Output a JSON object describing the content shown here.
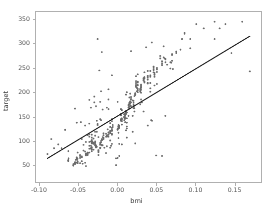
{
  "chart_data": {
    "type": "scatter",
    "title": "",
    "xlabel": "bmi",
    "ylabel": "target",
    "xlim": [
      -0.105,
      0.185
    ],
    "ylim": [
      14,
      366
    ],
    "xticks": [
      -0.1,
      -0.05,
      0.0,
      0.05,
      0.1,
      0.15
    ],
    "xtick_labels": [
      "-0.10",
      "-0.05",
      "0.00",
      "0.05",
      "0.10",
      "0.15"
    ],
    "yticks": [
      50,
      100,
      150,
      200,
      250,
      300,
      350
    ],
    "ytick_labels": [
      "50",
      "100",
      "150",
      "200",
      "250",
      "300",
      "350"
    ],
    "grid": false,
    "legend": null,
    "marker_color": "#6b6b6b",
    "marker_size": 1.7,
    "line_color": "#1a1a1a",
    "regression_line": {
      "x": [
        -0.0902,
        0.1706
      ],
      "y": [
        63.0,
        316.0
      ],
      "slope": 970.0,
      "intercept": 150.5
    },
    "n_points": 442,
    "x": [
      0.0617,
      -0.0514,
      0.0445,
      -0.0116,
      -0.0364,
      -0.0407,
      -0.0472,
      -0.0019,
      -0.0288,
      -0.0256,
      -0.0197,
      0.0498,
      -0.0299,
      -0.0116,
      0.0196,
      -0.0277,
      -0.0547,
      -0.0223,
      -0.0321,
      -0.0342,
      0.0024,
      -0.0018,
      0.0574,
      -0.0234,
      -0.0363,
      -0.0212,
      -0.0525,
      -0.0169,
      0.0391,
      -0.0202,
      -0.0266,
      -0.0342,
      -0.0115,
      0.0714,
      -0.0245,
      0.0175,
      -0.0061,
      0.0023,
      -0.0438,
      0.012,
      -0.0094,
      -0.0417,
      0.0304,
      0.0434,
      -0.0514,
      -0.0331,
      0.0315,
      -0.046,
      -0.0256,
      -0.0633,
      0.012,
      -0.0256,
      -0.046,
      -0.0072,
      0.0002,
      0.0229,
      0.0607,
      -0.0331,
      -0.0147,
      0.0595,
      -0.0212,
      -0.0363,
      -0.0482,
      0.0239,
      -0.0309,
      0.0218,
      0.0045,
      -0.0223,
      0.011,
      0.039,
      -0.0331,
      0.0153,
      -0.0417,
      0.0293,
      -0.0072,
      0.0682,
      -0.0202,
      -0.0299,
      0.0023,
      -0.0288,
      0.0369,
      -0.0137,
      -0.0094,
      -0.0083,
      0.0477,
      0.0832,
      -0.0245,
      -0.0277,
      0.0347,
      0.0261,
      -0.0277,
      -0.0536,
      -0.0191,
      0.011,
      -0.0331,
      0.0142,
      -0.0094,
      0.0239,
      -0.0525,
      0.0013,
      -0.0126,
      -0.0515,
      0.0196,
      -0.0331,
      0.0002,
      0.0443,
      -0.0148,
      -0.0363,
      0.0336,
      0.0508,
      -0.0223,
      0.012,
      -0.0406,
      0.0175,
      -0.0191,
      0.039,
      -0.0631,
      0.0013,
      -0.0072,
      0.0423,
      -0.0289,
      0.0261,
      -0.0482,
      0.025,
      0.0056,
      -0.0072,
      0.0693,
      -0.0385,
      -0.0137,
      0.0164,
      -0.0569,
      0.0304,
      -0.018,
      0.0088,
      -0.0202,
      0.1016,
      -0.0363,
      0.039,
      -0.0072,
      -0.0288,
      0.0551,
      -0.0223,
      0.0099,
      0.0218,
      -0.0547,
      0.0153,
      -0.0385,
      -0.0137,
      0.0261,
      -0.0633,
      0.0466,
      -0.0309,
      0.0207,
      0.0013,
      -0.0449,
      0.0304,
      -0.0116,
      0.0595,
      -0.0245,
      -0.018,
      0.0477,
      -0.0331,
      0.011,
      0.1252,
      -0.0212,
      0.0088,
      -0.0536,
      0.0336,
      -0.0061,
      -0.0266,
      0.0218,
      0.0704,
      -0.0417,
      0.0013,
      -0.0094,
      0.0239,
      -0.0363,
      0.0153,
      0.0864,
      -0.0277,
      0.0056,
      -0.018,
      0.0423,
      -0.0525,
      0.0196,
      0.0347,
      -0.0148,
      -0.0406,
      0.011,
      0.0574,
      -0.0331,
      0.0261,
      -0.0223,
      0.0682,
      -0.0569,
      0.0175,
      0.0002,
      -0.0288,
      0.039,
      -0.0072,
      0.0304,
      -0.0482,
      0.012,
      0.0508,
      -0.0245,
      -0.0137,
      0.0229,
      0.1317,
      -0.0363,
      0.0045,
      -0.0202,
      0.0466,
      -0.0515,
      0.0088,
      0.0293,
      -0.0331,
      0.0164,
      -0.0094,
      0.0619,
      -0.0277,
      0.0023,
      -0.0438,
      0.0336,
      0.0142,
      -0.0223,
      -0.0633,
      0.025,
      0.0758,
      -0.0309,
      0.0013,
      -0.0116,
      0.0207,
      -0.0385,
      0.0423,
      0.0099,
      -0.0547,
      0.0056,
      -0.0191,
      0.0551,
      -0.0266,
      0.0175,
      -0.046,
      0.0261,
      0.0088,
      -0.0342,
      0.039,
      -0.0072,
      0.0938,
      -0.0212,
      0.012,
      -0.0525,
      0.0304,
      0.0153,
      -0.0288,
      0.0477,
      -0.0137,
      0.0023,
      0.064,
      -0.0363,
      0.0218,
      -0.0406,
      0.0336,
      0.0045,
      -0.0223,
      0.011,
      0.0812,
      -0.0331,
      0.0164,
      -0.0094,
      0.0239,
      -0.0569,
      0.0013,
      0.0466,
      -0.0245,
      0.0099,
      -0.018,
      0.0293,
      -0.0482,
      0.0056,
      0.0574,
      -0.0309,
      0.0142,
      -0.0116,
      0.0207,
      0.0347,
      -0.0277,
      0.0001,
      0.0703,
      -0.0385,
      0.0261,
      -0.0202,
      0.0423,
      0.0088,
      -0.0633,
      0.0175,
      0.0508,
      -0.0342,
      0.012,
      -0.0072,
      0.039,
      -0.0515,
      0.0229,
      0.0304,
      -0.0288,
      0.0153,
      -0.0137,
      0.0619,
      0.0023,
      -0.046,
      0.0336,
      0.0045,
      -0.0223,
      0.0477,
      0.011,
      -0.0331,
      0.0164,
      -0.0094,
      0.0758,
      0.0239,
      -0.0547,
      0.0013,
      0.0466,
      -0.0245,
      0.0099,
      0.0293,
      -0.018,
      0.0056,
      -0.0406,
      0.0574,
      0.0142,
      -0.0309,
      0.0207,
      0.0347,
      -0.0116,
      0.0001,
      -0.0277,
      0.0864,
      0.0261,
      -0.0385,
      0.0423,
      0.0088,
      -0.0202,
      0.0175,
      -0.0633,
      0.0508,
      0.012,
      -0.0342,
      0.039,
      -0.0072,
      0.0229,
      -0.0515,
      0.0304,
      0.0153,
      -0.0288,
      0.0619,
      -0.0137,
      0.0023,
      0.0336,
      -0.046,
      0.0045,
      0.0477,
      -0.0223,
      0.011,
      0.0164,
      -0.0331,
      0.0938,
      -0.0094,
      0.0239,
      0.0013,
      -0.0547,
      0.0466,
      -0.0245,
      0.0099,
      0.0293,
      -0.018,
      0.0056,
      0.0574,
      -0.0406,
      0.0142,
      0.0207,
      -0.0309,
      0.0347,
      -0.0116,
      0.0001,
      0.0703,
      -0.0277,
      0.0261,
      0.0423,
      -0.0385,
      0.0088,
      0.0175,
      -0.0202,
      0.0508,
      -0.0633,
      0.012,
      0.039,
      -0.0342,
      0.0229,
      0.0304,
      -0.0072,
      0.1608,
      0.1706,
      0.1112,
      0.1392,
      -0.0853,
      -0.0902,
      -0.0763,
      -0.0818,
      0.1469,
      -0.0721,
      0.1252,
      -0.0674
    ],
    "y": [
      151,
      75,
      141,
      206,
      135,
      97,
      138,
      63,
      110,
      310,
      101,
      69,
      179,
      185,
      118,
      171,
      166,
      144,
      97,
      168,
      68,
      49,
      68,
      245,
      184,
      202,
      137,
      85,
      131,
      283,
      141,
      98,
      165,
      248,
      80,
      285,
      128,
      129,
      91,
      200,
      85,
      131,
      214,
      142,
      53,
      106,
      179,
      103,
      134,
      78,
      106,
      132,
      57,
      235,
      180,
      94,
      270,
      78,
      108,
      295,
      96,
      108,
      70,
      223,
      81,
      167,
      165,
      85,
      195,
      219,
      99,
      170,
      54,
      175,
      93,
      262,
      90,
      191,
      93,
      90,
      293,
      168,
      128,
      89,
      214,
      310,
      107,
      88,
      220,
      237,
      90,
      60,
      164,
      161,
      112,
      168,
      136,
      219,
      65,
      105,
      123,
      55,
      151,
      85,
      64,
      303,
      74,
      113,
      160,
      217,
      180,
      125,
      47,
      179,
      90,
      244,
      63,
      127,
      144,
      201,
      118,
      220,
      53,
      202,
      92,
      112,
      261,
      70,
      88,
      197,
      48,
      185,
      104,
      142,
      91,
      341,
      75,
      230,
      140,
      93,
      275,
      84,
      138,
      160,
      52,
      189,
      111,
      110,
      200,
      59,
      252,
      104,
      172,
      129,
      52,
      210,
      108,
      272,
      70,
      103,
      232,
      99,
      121,
      346,
      142,
      155,
      54,
      225,
      132,
      118,
      172,
      279,
      77,
      116,
      100,
      233,
      97,
      178,
      321,
      88,
      163,
      115,
      208,
      63,
      183,
      241,
      114,
      73,
      155,
      264,
      101,
      214,
      91,
      249,
      51,
      190,
      124,
      96,
      234,
      126,
      199,
      68,
      146,
      242,
      80,
      109,
      196,
      332,
      89,
      155,
      102,
      246,
      57,
      149,
      206,
      94,
      176,
      120,
      268,
      86,
      131,
      79,
      225,
      174,
      92,
      60,
      209,
      281,
      95,
      129,
      113,
      167,
      73,
      219,
      151,
      55,
      143,
      107,
      270,
      87,
      186,
      65,
      222,
      148,
      84,
      233,
      122,
      310,
      99,
      158,
      61,
      205,
      177,
      91,
      237,
      110,
      128,
      257,
      83,
      192,
      71,
      228,
      152,
      95,
      160,
      288,
      86,
      181,
      119,
      215,
      49,
      125,
      248,
      76,
      147,
      106,
      201,
      64,
      140,
      263,
      93,
      172,
      113,
      178,
      231,
      88,
      123,
      277,
      74,
      207,
      101,
      244,
      154,
      58,
      190,
      250,
      84,
      158,
      120,
      226,
      56,
      198,
      212,
      90,
      175,
      109,
      269,
      127,
      66,
      229,
      144,
      85,
      236,
      159,
      96,
      180,
      115,
      284,
      211,
      51,
      130,
      241,
      78,
      153,
      203,
      111,
      146,
      69,
      259,
      168,
      94,
      174,
      222,
      117,
      124,
      87,
      323,
      215,
      72,
      232,
      149,
      102,
      185,
      57,
      247,
      137,
      89,
      219,
      114,
      196,
      62,
      209,
      166,
      98,
      262,
      108,
      126,
      224,
      67,
      141,
      240,
      92,
      157,
      172,
      82,
      291,
      118,
      213,
      132,
      54,
      253,
      79,
      145,
      207,
      105,
      133,
      256,
      71,
      151,
      182,
      95,
      228,
      112,
      122,
      265,
      86,
      204,
      235,
      75,
      147,
      171,
      103,
      250,
      59,
      129,
      218,
      83,
      194,
      216,
      121,
      346,
      243,
      332,
      341,
      103,
      72,
      92,
      84,
      281,
      84,
      310,
      122
    ]
  },
  "axes": {
    "spine_color": "#b0b0b0",
    "tick_color": "#555555",
    "background": "#ffffff"
  }
}
